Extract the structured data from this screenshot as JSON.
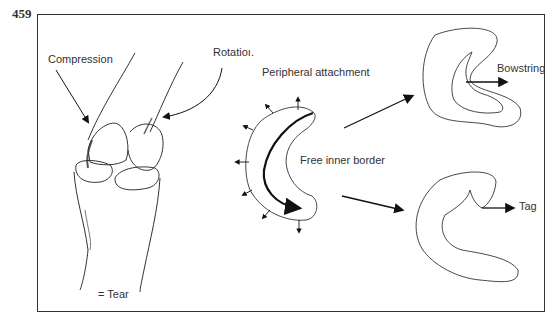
{
  "figure": {
    "page_number": "459",
    "labels": {
      "compression": "Compression",
      "rotation": "Rotatioı.",
      "peripheral_attachment": "Peripheral attachment",
      "free_inner_border": "Free inner border",
      "bowstring": "Bowstring",
      "tag": "Tag",
      "tear_legend": "= Tear"
    },
    "colors": {
      "line": "#222222",
      "background": "#ffffff",
      "frame": "#333333"
    }
  }
}
